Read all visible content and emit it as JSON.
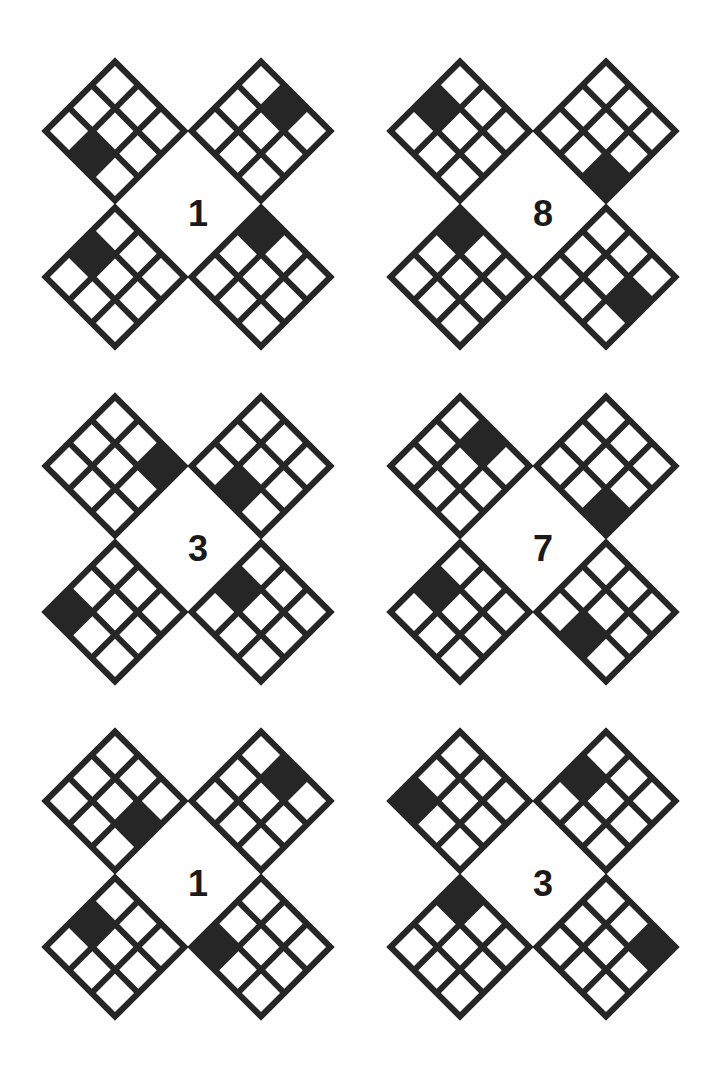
{
  "page": {
    "background_color": "#ffffff",
    "ink_color": "#262626",
    "width": 723,
    "height": 1081,
    "grid_size": 3,
    "groups_per_row": 2,
    "group_rows": 3
  },
  "legend": {
    "row_axis": "row index increases toward the lower-left edge",
    "col_axis": "column index increases toward the lower-right edge",
    "origin": "cell (0,0) is the topmost cell of each diamond",
    "filled_color": "#262626",
    "empty_color": "#ffffff"
  },
  "groups": [
    {
      "id": "group-1",
      "digit": "1",
      "position": {
        "left": 42,
        "top": 58
      },
      "diamonds": [
        {
          "slot": "top-left",
          "filled_cell": {
            "row": 2,
            "col": 1
          }
        },
        {
          "slot": "top-right",
          "filled_cell": {
            "row": 0,
            "col": 1
          }
        },
        {
          "slot": "bottom-left",
          "filled_cell": {
            "row": 1,
            "col": 0
          }
        },
        {
          "slot": "bottom-right",
          "filled_cell": {
            "row": 0,
            "col": 0
          }
        }
      ]
    },
    {
      "id": "group-2",
      "digit": "8",
      "position": {
        "left": 387,
        "top": 58
      },
      "diamonds": [
        {
          "slot": "top-left",
          "filled_cell": {
            "row": 1,
            "col": 0
          }
        },
        {
          "slot": "top-right",
          "filled_cell": {
            "row": 2,
            "col": 2
          }
        },
        {
          "slot": "bottom-left",
          "filled_cell": {
            "row": 0,
            "col": 0
          }
        },
        {
          "slot": "bottom-right",
          "filled_cell": {
            "row": 1,
            "col": 2
          }
        }
      ]
    },
    {
      "id": "group-3",
      "digit": "3",
      "position": {
        "left": 42,
        "top": 393
      },
      "diamonds": [
        {
          "slot": "top-left",
          "filled_cell": {
            "row": 0,
            "col": 2
          }
        },
        {
          "slot": "top-right",
          "filled_cell": {
            "row": 2,
            "col": 1
          }
        },
        {
          "slot": "bottom-left",
          "filled_cell": {
            "row": 2,
            "col": 0
          }
        },
        {
          "slot": "bottom-right",
          "filled_cell": {
            "row": 1,
            "col": 0
          }
        }
      ]
    },
    {
      "id": "group-4",
      "digit": "7",
      "position": {
        "left": 387,
        "top": 393
      },
      "diamonds": [
        {
          "slot": "top-left",
          "filled_cell": {
            "row": 0,
            "col": 1
          }
        },
        {
          "slot": "top-right",
          "filled_cell": {
            "row": 2,
            "col": 2
          }
        },
        {
          "slot": "bottom-left",
          "filled_cell": {
            "row": 1,
            "col": 0
          }
        },
        {
          "slot": "bottom-right",
          "filled_cell": {
            "row": 2,
            "col": 1
          }
        }
      ]
    },
    {
      "id": "group-5",
      "digit": "1",
      "position": {
        "left": 42,
        "top": 728
      },
      "diamonds": [
        {
          "slot": "top-left",
          "filled_cell": {
            "row": 1,
            "col": 2
          }
        },
        {
          "slot": "top-right",
          "filled_cell": {
            "row": 0,
            "col": 1
          }
        },
        {
          "slot": "bottom-left",
          "filled_cell": {
            "row": 1,
            "col": 0
          }
        },
        {
          "slot": "bottom-right",
          "filled_cell": {
            "row": 2,
            "col": 0
          }
        }
      ]
    },
    {
      "id": "group-6",
      "digit": "3",
      "position": {
        "left": 387,
        "top": 728
      },
      "diamonds": [
        {
          "slot": "top-left",
          "filled_cell": {
            "row": 2,
            "col": 0
          }
        },
        {
          "slot": "top-right",
          "filled_cell": {
            "row": 1,
            "col": 0
          }
        },
        {
          "slot": "bottom-left",
          "filled_cell": {
            "row": 0,
            "col": 0
          }
        },
        {
          "slot": "bottom-right",
          "filled_cell": {
            "row": 0,
            "col": 2
          }
        }
      ]
    }
  ]
}
